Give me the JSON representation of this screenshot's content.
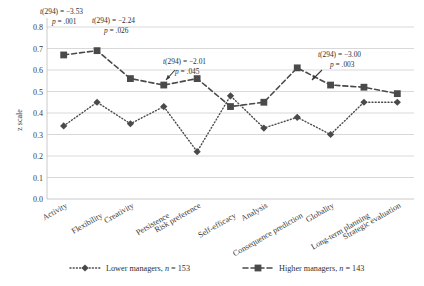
{
  "chart_data": {
    "type": "line",
    "title": "",
    "xlabel": "",
    "ylabel": "z scale",
    "ylim": [
      0.0,
      0.8
    ],
    "grid": true,
    "legend_position": "bottom",
    "categories": [
      "Activity",
      "Flexibility",
      "Creativity",
      "Persistence",
      "Risk preference",
      "Self-efficacy",
      "Analysis",
      "Consequence prediction",
      "Globality",
      "Long-term planning",
      "Strategic evaluation"
    ],
    "ytick_labels": [
      "0.0",
      "0.1",
      "0.2",
      "0.3",
      "0.4",
      "0.5",
      "0.6",
      "0.7",
      "0.8"
    ],
    "ytick_values": [
      0.0,
      0.1,
      0.2,
      0.3,
      0.4,
      0.5,
      0.6,
      0.7,
      0.8
    ],
    "series": [
      {
        "name": "Lower managers, n = 153",
        "marker": "diamond",
        "line_style": "dotted",
        "color": "#4a4a4a",
        "values": [
          0.34,
          0.45,
          0.35,
          0.43,
          0.22,
          0.48,
          0.33,
          0.38,
          0.3,
          0.45,
          0.45
        ]
      },
      {
        "name": "Higher managers, n = 143",
        "marker": "square",
        "line_style": "dashed",
        "color": "#4a4a4a",
        "values": [
          0.67,
          0.69,
          0.56,
          0.53,
          0.56,
          0.43,
          0.45,
          0.61,
          0.53,
          0.52,
          0.49
        ]
      }
    ],
    "annotations": [
      {
        "id": "annot-activity",
        "line1": "t(294) = −3.53",
        "line2": "p = .001",
        "x": 40,
        "y": 14
      },
      {
        "id": "annot-flexibility",
        "line1": "t(294) = −2.24",
        "line2": "p = .026",
        "x": 92,
        "y": 23
      },
      {
        "id": "annot-self-efficacy",
        "line1": "t(294) = −2.01",
        "line2": "p = .045",
        "x": 163,
        "y": 64
      },
      {
        "id": "annot-long-term-planning",
        "line1": "t(294) = −3.00",
        "line2": "p = .003",
        "x": 318,
        "y": 57
      }
    ]
  },
  "legend": {
    "items": [
      {
        "label": "Lower managers, n = 153",
        "marker": "diamond",
        "line_style": "dotted"
      },
      {
        "label": "Higher managers, n = 143",
        "marker": "square",
        "line_style": "dashed"
      }
    ]
  },
  "axis": {
    "y_title": "z scale"
  }
}
